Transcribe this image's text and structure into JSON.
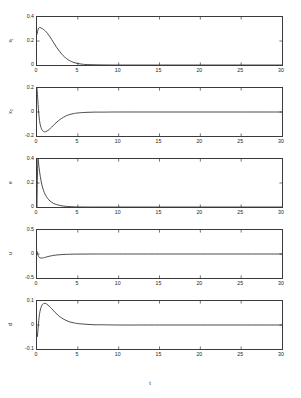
{
  "figure": {
    "xlabel": "t",
    "faint_header": "",
    "axis_color": "#3a3a3a",
    "curve_color": "#2a2a2a",
    "background": "#ffffff"
  },
  "chart_data": [
    {
      "type": "line",
      "title": "",
      "xlabel": "",
      "ylabel": "x_1",
      "ylabel_display": "x₁",
      "xlim": [
        0,
        30
      ],
      "ylim": [
        0,
        0.4
      ],
      "xticks": [
        0,
        5,
        10,
        15,
        20,
        25,
        30
      ],
      "yticks": [
        0,
        0.2,
        0.4
      ],
      "ytick_labels": [
        "0",
        "0.2",
        "0.4"
      ],
      "grid": false,
      "legend": "none",
      "x": [
        0,
        0.15,
        0.3,
        0.5,
        0.8,
        1.0,
        1.3,
        1.6,
        2.0,
        2.4,
        2.8,
        3.2,
        3.6,
        4.0,
        4.5,
        5.0,
        5.5,
        6.0,
        7.0,
        8.0,
        10.0,
        15.0,
        20.0,
        25.0,
        30.0
      ],
      "values": [
        0.255,
        0.3,
        0.312,
        0.309,
        0.296,
        0.285,
        0.262,
        0.233,
        0.19,
        0.147,
        0.11,
        0.078,
        0.054,
        0.036,
        0.021,
        0.012,
        0.007,
        0.004,
        0.002,
        0.001,
        0.0,
        0.0,
        0.0,
        0.0,
        0.0
      ]
    },
    {
      "type": "line",
      "title": "",
      "xlabel": "",
      "ylabel": "x_2",
      "ylabel_display": "x₂",
      "xlim": [
        0,
        30
      ],
      "ylim": [
        -0.2,
        0.2
      ],
      "xticks": [
        0,
        5,
        10,
        15,
        20,
        25,
        30
      ],
      "yticks": [
        -0.2,
        0,
        0.2
      ],
      "ytick_labels": [
        "-0.2",
        "0",
        "0.2"
      ],
      "grid": false,
      "legend": "none",
      "x": [
        0,
        0.08,
        0.2,
        0.35,
        0.55,
        0.8,
        1.0,
        1.2,
        1.5,
        1.8,
        2.2,
        2.6,
        3.0,
        3.5,
        4.0,
        4.5,
        5.0,
        6.0,
        7.0,
        8.0,
        10.0,
        15.0,
        20.0,
        25.0,
        30.0
      ],
      "values": [
        0.198,
        0.12,
        0.0,
        -0.09,
        -0.14,
        -0.162,
        -0.165,
        -0.16,
        -0.145,
        -0.126,
        -0.098,
        -0.074,
        -0.054,
        -0.034,
        -0.021,
        -0.013,
        -0.008,
        -0.003,
        -0.001,
        -0.001,
        0.0,
        0.0,
        0.0,
        0.0,
        0.0
      ]
    },
    {
      "type": "line",
      "title": "",
      "xlabel": "",
      "ylabel": "e",
      "ylabel_display": "e",
      "xlim": [
        0,
        30
      ],
      "ylim": [
        0,
        0.4
      ],
      "xticks": [
        0,
        5,
        10,
        15,
        20,
        25,
        30
      ],
      "yticks": [
        0,
        0.2,
        0.4
      ],
      "ytick_labels": [
        "0",
        "0.2",
        "0.4"
      ],
      "grid": false,
      "legend": "none",
      "x": [
        0,
        0.05,
        0.12,
        0.25,
        0.4,
        0.6,
        0.8,
        1.0,
        1.3,
        1.6,
        2.0,
        2.4,
        2.8,
        3.2,
        3.6,
        4.0,
        4.5,
        5.0,
        6.0,
        7.0,
        10.0,
        15.0,
        20.0,
        25.0,
        30.0
      ],
      "values": [
        0.0,
        0.25,
        0.398,
        0.33,
        0.255,
        0.185,
        0.138,
        0.105,
        0.072,
        0.05,
        0.031,
        0.02,
        0.013,
        0.008,
        0.005,
        0.004,
        0.002,
        0.001,
        0.0,
        0.0,
        0.0,
        0.0,
        0.0,
        0.0,
        0.0
      ]
    },
    {
      "type": "line",
      "title": "",
      "xlabel": "",
      "ylabel": "u",
      "ylabel_display": "u",
      "xlim": [
        0,
        30
      ],
      "ylim": [
        -0.5,
        0.5
      ],
      "xticks": [
        0,
        5,
        10,
        15,
        20,
        25,
        30
      ],
      "yticks": [
        -0.5,
        0,
        0.5
      ],
      "ytick_labels": [
        "-0.5",
        "0",
        "0.5"
      ],
      "grid": false,
      "legend": "none",
      "x": [
        0,
        0.06,
        0.15,
        0.3,
        0.5,
        0.7,
        0.9,
        1.2,
        1.5,
        1.9,
        2.3,
        2.8,
        3.3,
        4.0,
        5.0,
        6.0,
        7.0,
        8.0,
        10.0,
        15.0,
        20.0,
        25.0,
        30.0
      ],
      "values": [
        0.055,
        0.02,
        -0.035,
        -0.072,
        -0.085,
        -0.082,
        -0.074,
        -0.06,
        -0.047,
        -0.033,
        -0.023,
        -0.015,
        -0.009,
        -0.005,
        -0.002,
        -0.001,
        0.0,
        0.0,
        0.0,
        0.0,
        0.0,
        0.0,
        0.0
      ]
    },
    {
      "type": "line",
      "title": "",
      "xlabel": "t",
      "ylabel": "d",
      "ylabel_display": "d",
      "xlim": [
        0,
        30
      ],
      "ylim": [
        -0.1,
        0.1
      ],
      "xticks": [
        0,
        5,
        10,
        15,
        20,
        25,
        30
      ],
      "yticks": [
        -0.1,
        0,
        0.1
      ],
      "ytick_labels": [
        "-0.1",
        "0",
        "0.1"
      ],
      "grid": false,
      "legend": "none",
      "x": [
        0,
        0.05,
        0.12,
        0.25,
        0.4,
        0.6,
        0.8,
        1.0,
        1.2,
        1.5,
        1.8,
        2.2,
        2.6,
        3.0,
        3.5,
        4.0,
        4.5,
        5.0,
        6.0,
        7.0,
        8.0,
        10.0,
        15.0,
        20.0,
        25.0,
        30.0
      ],
      "values": [
        -0.04,
        -0.048,
        -0.02,
        0.03,
        0.062,
        0.082,
        0.089,
        0.09,
        0.087,
        0.078,
        0.068,
        0.053,
        0.04,
        0.03,
        0.02,
        0.013,
        0.009,
        0.006,
        0.003,
        0.001,
        0.001,
        0.0,
        0.0,
        0.0,
        0.0,
        0.0
      ]
    }
  ]
}
